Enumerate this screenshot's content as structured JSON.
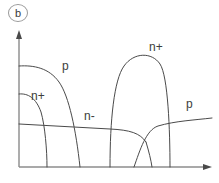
{
  "figure": {
    "panel_label": "b",
    "axes": {
      "y_axis": {
        "name": "concentration-axis",
        "arrow": true
      },
      "x_axis": {
        "name": "depth-axis",
        "arrow": true
      },
      "origin_px": [
        19,
        167
      ],
      "y_top_px": 32,
      "x_right_px": 212
    },
    "labels": {
      "p_left": "p",
      "n_plus_left": "n+",
      "n_minus": "n-",
      "n_plus_right": "n+",
      "p_right": "p"
    },
    "colors": {
      "curve": "#4a4a4a",
      "axis": "#6a6a6a",
      "text": "#3d3d3d",
      "background": "#ffffff"
    }
  },
  "chart_data": {
    "type": "line",
    "title": "",
    "subtitle": "",
    "xlabel": "",
    "ylabel": "",
    "xlim": [
      0,
      200
    ],
    "ylim": [
      0,
      140
    ],
    "grid": false,
    "legend": "inline-annotations",
    "annotations": [
      {
        "text": "p",
        "x": 62,
        "y": 66
      },
      {
        "text": "n+",
        "x": 31,
        "y": 96
      },
      {
        "text": "n-",
        "x": 84,
        "y": 116
      },
      {
        "text": "n+",
        "x": 150,
        "y": 47
      },
      {
        "text": "p",
        "x": 186,
        "y": 104
      }
    ],
    "series": [
      {
        "name": "p_left",
        "label": "p",
        "path": "M 19 66 C 34 65, 49 68, 59 82 C 69 96, 76 130, 80 167"
      },
      {
        "name": "n_plus_left",
        "label": "n+",
        "path": "M 19 94 C 28 93, 36 98, 41 112 C 45 126, 47 150, 47 167"
      },
      {
        "name": "n_minus_background",
        "label": "n-",
        "path": "M 19 124 L 110 129 C 130 130, 140 133, 146 142"
      },
      {
        "name": "n_plus_right",
        "label": "n+",
        "path": "M 110 167 C 110 120, 114 80, 124 66 C 134 52, 152 52, 160 64 C 168 76, 170 130, 170 167"
      },
      {
        "name": "p_right_rising",
        "label": "p",
        "path": "M 134 167 C 140 150, 146 130, 158 126 C 175 121, 195 120, 212 118"
      },
      {
        "name": "p_right_falling_tail",
        "label": "",
        "path": "M 146 142 C 149 152, 151 160, 152 167"
      }
    ]
  }
}
